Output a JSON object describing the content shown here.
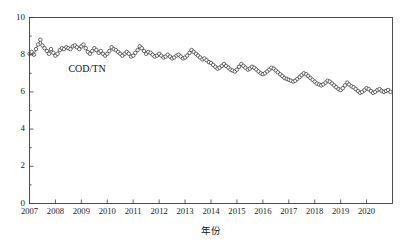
{
  "figure": {
    "title_partial": "",
    "width": 408,
    "height": 245
  },
  "chart_data": {
    "type": "line",
    "title": "",
    "xlabel": "年份",
    "ylabel": "",
    "xlim": [
      2007,
      2021
    ],
    "ylim": [
      0,
      10
    ],
    "grid": false,
    "legend_position": "inline-annotation",
    "xticks": [
      2007,
      2008,
      2009,
      2010,
      2011,
      2012,
      2013,
      2014,
      2015,
      2016,
      2017,
      2018,
      2019,
      2020
    ],
    "xtick_labels": [
      "2007",
      "2008",
      "2009",
      "2010",
      "2011",
      "2012",
      "2013",
      "2014",
      "2015",
      "2016",
      "2017",
      "2018",
      "2019",
      "2020"
    ],
    "yticks": [
      0,
      2,
      4,
      6,
      8,
      10
    ],
    "ytick_labels": [
      "0",
      "2",
      "4",
      "6",
      "8",
      "10"
    ],
    "annotations": [
      {
        "text": "COD/TN",
        "x": 2008.5,
        "y": 7.05
      }
    ],
    "series": [
      {
        "name": "COD/TN",
        "marker": "open-circle",
        "color": "#2a2a2a",
        "x": [
          2007.0,
          2007.08,
          2007.17,
          2007.25,
          2007.33,
          2007.42,
          2007.5,
          2007.58,
          2007.67,
          2007.75,
          2007.83,
          2007.92,
          2008.0,
          2008.08,
          2008.17,
          2008.25,
          2008.33,
          2008.42,
          2008.5,
          2008.58,
          2008.67,
          2008.75,
          2008.83,
          2008.92,
          2009.0,
          2009.08,
          2009.17,
          2009.25,
          2009.33,
          2009.42,
          2009.5,
          2009.58,
          2009.67,
          2009.75,
          2009.83,
          2009.92,
          2010.0,
          2010.08,
          2010.17,
          2010.25,
          2010.33,
          2010.42,
          2010.5,
          2010.58,
          2010.67,
          2010.75,
          2010.83,
          2010.92,
          2011.0,
          2011.08,
          2011.17,
          2011.25,
          2011.33,
          2011.42,
          2011.5,
          2011.58,
          2011.67,
          2011.75,
          2011.83,
          2011.92,
          2012.0,
          2012.08,
          2012.17,
          2012.25,
          2012.33,
          2012.42,
          2012.5,
          2012.58,
          2012.67,
          2012.75,
          2012.83,
          2012.92,
          2013.0,
          2013.08,
          2013.17,
          2013.25,
          2013.33,
          2013.42,
          2013.5,
          2013.58,
          2013.67,
          2013.75,
          2013.83,
          2013.92,
          2014.0,
          2014.08,
          2014.17,
          2014.25,
          2014.33,
          2014.42,
          2014.5,
          2014.58,
          2014.67,
          2014.75,
          2014.83,
          2014.92,
          2015.0,
          2015.08,
          2015.17,
          2015.25,
          2015.33,
          2015.42,
          2015.5,
          2015.58,
          2015.67,
          2015.75,
          2015.83,
          2015.92,
          2016.0,
          2016.08,
          2016.17,
          2016.25,
          2016.33,
          2016.42,
          2016.5,
          2016.58,
          2016.67,
          2016.75,
          2016.83,
          2016.92,
          2017.0,
          2017.08,
          2017.17,
          2017.25,
          2017.33,
          2017.42,
          2017.5,
          2017.58,
          2017.67,
          2017.75,
          2017.83,
          2017.92,
          2018.0,
          2018.08,
          2018.17,
          2018.25,
          2018.33,
          2018.42,
          2018.5,
          2018.58,
          2018.67,
          2018.75,
          2018.83,
          2018.92,
          2019.0,
          2019.08,
          2019.17,
          2019.25,
          2019.33,
          2019.42,
          2019.5,
          2019.58,
          2019.67,
          2019.75,
          2019.83,
          2019.92,
          2020.0,
          2020.08,
          2020.17,
          2020.25,
          2020.33,
          2020.42,
          2020.5,
          2020.58,
          2020.67,
          2020.75,
          2020.83,
          2020.92
        ],
        "values": [
          8.05,
          8.15,
          8.0,
          8.3,
          8.55,
          8.8,
          8.5,
          8.35,
          8.2,
          8.05,
          8.3,
          8.1,
          7.95,
          8.05,
          8.25,
          8.35,
          8.3,
          8.4,
          8.35,
          8.3,
          8.45,
          8.5,
          8.4,
          8.3,
          8.45,
          8.55,
          8.35,
          8.15,
          8.05,
          8.2,
          8.35,
          8.25,
          8.1,
          8.2,
          8.05,
          7.95,
          8.05,
          8.2,
          8.4,
          8.3,
          8.25,
          8.15,
          8.05,
          7.95,
          8.05,
          8.15,
          8.05,
          7.9,
          7.95,
          8.1,
          8.25,
          8.45,
          8.35,
          8.2,
          8.05,
          8.15,
          8.1,
          8.0,
          7.9,
          7.95,
          8.05,
          7.95,
          7.85,
          7.9,
          8.0,
          7.9,
          7.8,
          7.85,
          7.95,
          8.0,
          7.9,
          7.8,
          7.85,
          7.95,
          8.1,
          8.25,
          8.15,
          8.05,
          7.95,
          7.85,
          7.75,
          7.8,
          7.7,
          7.6,
          7.55,
          7.45,
          7.35,
          7.25,
          7.3,
          7.4,
          7.5,
          7.4,
          7.3,
          7.2,
          7.15,
          7.1,
          7.2,
          7.35,
          7.5,
          7.4,
          7.3,
          7.2,
          7.25,
          7.35,
          7.3,
          7.2,
          7.1,
          7.0,
          6.95,
          7.0,
          7.1,
          7.2,
          7.3,
          7.25,
          7.15,
          7.05,
          6.95,
          6.85,
          6.75,
          6.7,
          6.65,
          6.6,
          6.55,
          6.6,
          6.7,
          6.8,
          6.9,
          7.0,
          6.95,
          6.85,
          6.75,
          6.65,
          6.55,
          6.45,
          6.4,
          6.35,
          6.4,
          6.5,
          6.6,
          6.55,
          6.45,
          6.35,
          6.25,
          6.15,
          6.1,
          6.2,
          6.35,
          6.5,
          6.4,
          6.3,
          6.25,
          6.15,
          6.05,
          5.95,
          6.0,
          6.1,
          6.2,
          6.15,
          6.05,
          5.95,
          6.0,
          6.1,
          6.15,
          6.05,
          6.0,
          6.05,
          6.1,
          6.0
        ]
      }
    ]
  }
}
